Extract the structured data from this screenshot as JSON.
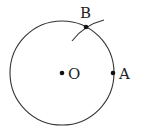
{
  "figure": {
    "type": "geometry-construction",
    "circle": {
      "center_label": "O",
      "cx": 62,
      "cy": 73,
      "r": 52,
      "stroke": "#333333"
    },
    "points": [
      {
        "id": "O",
        "label": "O",
        "x": 62,
        "y": 73
      },
      {
        "id": "A",
        "label": "A",
        "x": 113,
        "y": 73
      },
      {
        "id": "B",
        "label": "B",
        "x": 86,
        "y": 27
      }
    ],
    "arc": {
      "description": "construction arc centered at A through B",
      "stroke": "#333333"
    }
  }
}
